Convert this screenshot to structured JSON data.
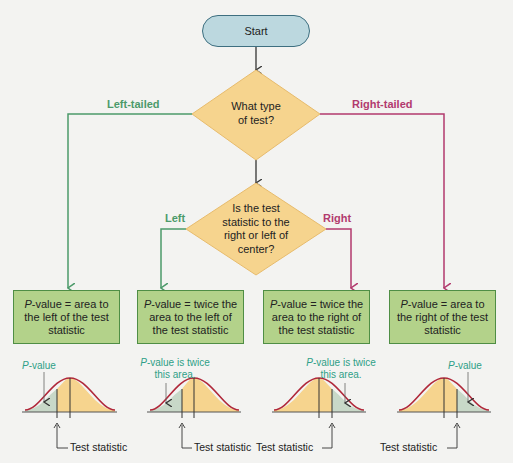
{
  "start": {
    "label": "Start"
  },
  "decision1": {
    "line1": "What type",
    "line2": "of test?"
  },
  "decision2": {
    "line1": "Is the test",
    "line2": "statistic to the",
    "line3": "right or left of",
    "line4": "center?"
  },
  "branches": {
    "left_tailed": "Left-tailed",
    "right_tailed": "Right-tailed",
    "left": "Left",
    "right": "Right"
  },
  "boxes": [
    {
      "p": "P",
      "rest": "-value = area to the left of the test statistic"
    },
    {
      "p": "P",
      "rest": "-value = twice the area to the left of the test statistic"
    },
    {
      "p": "P",
      "rest": "-value = twice the area to the right of the test statistic"
    },
    {
      "p": "P",
      "rest": "-value = area to the right of the test statistic"
    }
  ],
  "captions": [
    {
      "p": "P",
      "rest": "-value"
    },
    {
      "p": "P",
      "rest": "-value is twice this area."
    },
    {
      "p": "P",
      "rest": "-value is twice this area."
    },
    {
      "p": "P",
      "rest": "-value"
    }
  ],
  "test_statistic_label": "Test statistic",
  "colors": {
    "left_branch": "#4c9a6a",
    "right_branch": "#b23a6e",
    "box_fill": "#b3d28a",
    "diamond_fill": "#f6d48e",
    "start_fill": "#bcd8df",
    "curve": "#b0283a",
    "curve_fill": "#f6d48e",
    "tail_fill": "#c8d8c8"
  }
}
